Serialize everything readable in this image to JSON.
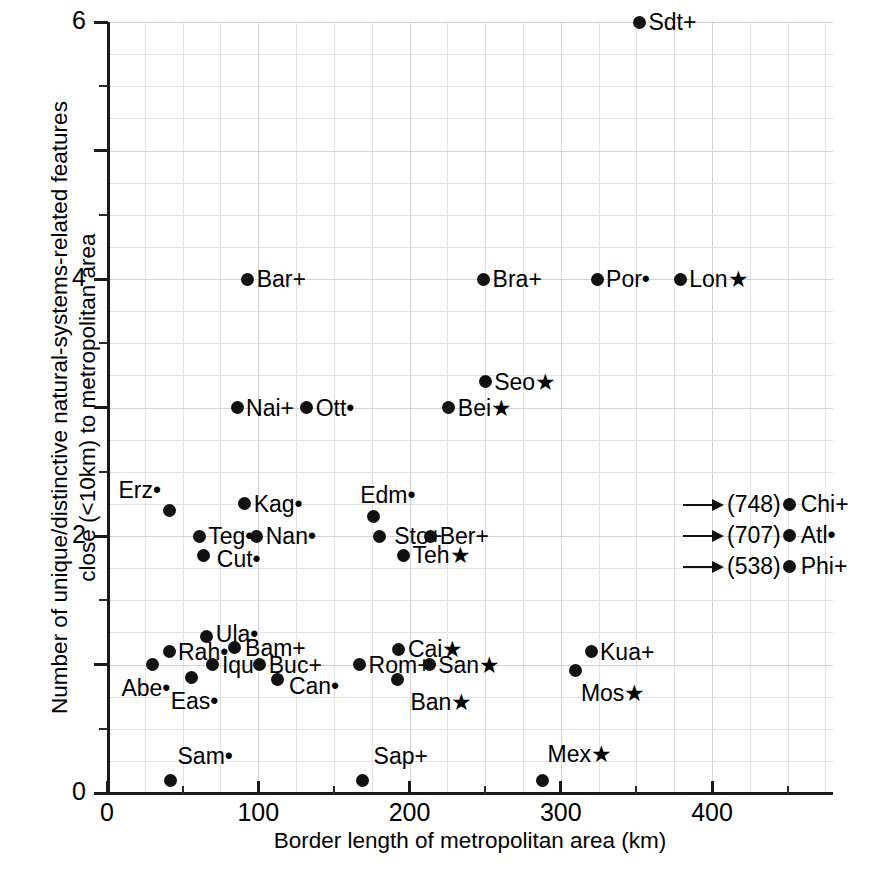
{
  "chart_data": {
    "type": "scatter",
    "title": "",
    "xlabel": "Border length of metropolitan area (km)",
    "ylabel_line1": "Number of unique/distinctive natural-systems-related features",
    "ylabel_line2": "close (<10km) to metropolitan area",
    "xlim": [
      0,
      480
    ],
    "ylim": [
      0,
      6
    ],
    "x_major_ticks": [
      0,
      100,
      200,
      300,
      400
    ],
    "x_major_tick_labels": [
      "0",
      "100",
      "200",
      "300",
      "400"
    ],
    "x_minor_ticks": [
      50,
      150,
      250,
      350,
      450
    ],
    "y_major_ticks": [
      0,
      1,
      2,
      3,
      4,
      5,
      6
    ],
    "y_major_tick_labels": [
      "0",
      "",
      "2",
      "",
      "4",
      "",
      "6"
    ],
    "y_visible_tick_labels": [
      "0",
      "2",
      "4",
      "6"
    ],
    "grid": true,
    "legend_position": "inside-right",
    "marker": "filled-circle",
    "points": [
      {
        "name": "Sdt+",
        "label": "Sdt+",
        "x": 352,
        "y": 6.0,
        "label_side": "right",
        "suffix": "+"
      },
      {
        "name": "Bar+",
        "label": "Bar+",
        "x": 93,
        "y": 4.0,
        "label_side": "right",
        "suffix": "+"
      },
      {
        "name": "Bra+",
        "label": "Bra+",
        "x": 249,
        "y": 4.0,
        "label_side": "right",
        "suffix": "+"
      },
      {
        "name": "Por.",
        "label": "Por•",
        "x": 324,
        "y": 4.0,
        "label_side": "right",
        "suffix": "dot"
      },
      {
        "name": "Lon*",
        "label": "Lon★",
        "x": 379,
        "y": 4.0,
        "label_side": "right",
        "suffix": "star"
      },
      {
        "name": "Seo*",
        "label": "Seo★",
        "x": 250,
        "y": 3.2,
        "label_side": "right",
        "suffix": "star"
      },
      {
        "name": "Nai+",
        "label": "Nai+",
        "x": 86,
        "y": 3.0,
        "label_side": "right",
        "suffix": "+"
      },
      {
        "name": "Ott.",
        "label": "Ott•",
        "x": 132,
        "y": 3.0,
        "label_side": "right",
        "suffix": "dot"
      },
      {
        "name": "Bei*",
        "label": "Bei★",
        "x": 226,
        "y": 3.0,
        "label_side": "right",
        "suffix": "star"
      },
      {
        "name": "Erz.",
        "label": "Erz•",
        "x": 41,
        "y": 2.2,
        "label_side": "right-offset",
        "suffix": "dot"
      },
      {
        "name": "Kag.",
        "label": "Kag•",
        "x": 91,
        "y": 2.25,
        "label_side": "right",
        "suffix": "dot"
      },
      {
        "name": "Teg.",
        "label": "Teg•",
        "x": 61,
        "y": 2.0,
        "label_side": "right",
        "suffix": "dot"
      },
      {
        "name": "Nan.",
        "label": "Nan•",
        "x": 99,
        "y": 2.0,
        "label_side": "right",
        "suffix": "dot"
      },
      {
        "name": "Cut.",
        "label": "Cut•",
        "x": 64,
        "y": 1.85,
        "label_side": "right",
        "suffix": "dot"
      },
      {
        "name": "Edm.",
        "label": "Edm•",
        "x": 176,
        "y": 2.15,
        "label_side": "right",
        "suffix": "dot"
      },
      {
        "name": "Sto+",
        "label": "Sto+",
        "x": 180,
        "y": 2.0,
        "label_side": "right",
        "suffix": "+"
      },
      {
        "name": "Ber+",
        "label": "Ber+",
        "x": 214,
        "y": 2.0,
        "label_side": "right",
        "suffix": "+"
      },
      {
        "name": "Teh*",
        "label": "Teh★",
        "x": 196,
        "y": 1.85,
        "label_side": "right",
        "suffix": "star"
      },
      {
        "name": "Ula.",
        "label": "Ula•",
        "x": 66,
        "y": 1.22,
        "label_side": "right",
        "suffix": "dot"
      },
      {
        "name": "Bam+",
        "label": "Bam+",
        "x": 84,
        "y": 1.13,
        "label_side": "right",
        "suffix": "+"
      },
      {
        "name": "Rah.",
        "label": "Rah•",
        "x": 41,
        "y": 1.1,
        "label_side": "right",
        "suffix": "dot"
      },
      {
        "name": "Abe.",
        "label": "Abe•",
        "x": 30,
        "y": 1.0,
        "label_side": "below-left",
        "suffix": "dot"
      },
      {
        "name": "Iqu.",
        "label": "Iqu•",
        "x": 70,
        "y": 1.0,
        "label_side": "right",
        "suffix": "dot"
      },
      {
        "name": "Buc+",
        "label": "Buc+",
        "x": 101,
        "y": 1.0,
        "label_side": "right",
        "suffix": "+"
      },
      {
        "name": "Rom+",
        "label": "Rom+",
        "x": 167,
        "y": 1.0,
        "label_side": "right",
        "suffix": "+"
      },
      {
        "name": "San*",
        "label": "San★",
        "x": 213,
        "y": 1.0,
        "label_side": "right",
        "suffix": "star"
      },
      {
        "name": "Cai*",
        "label": "Cai★",
        "x": 193,
        "y": 1.12,
        "label_side": "right",
        "suffix": "star"
      },
      {
        "name": "Ban*",
        "label": "Ban★",
        "x": 192,
        "y": 0.88,
        "label_side": "right",
        "suffix": "star"
      },
      {
        "name": "Eas.",
        "label": "Eas•",
        "x": 56,
        "y": 0.9,
        "label_side": "right",
        "suffix": "dot"
      },
      {
        "name": "Can.",
        "label": "Can•",
        "x": 113,
        "y": 0.88,
        "label_side": "right",
        "suffix": "dot"
      },
      {
        "name": "Kua+",
        "label": "Kua+",
        "x": 320,
        "y": 1.1,
        "label_side": "right",
        "suffix": "+"
      },
      {
        "name": "Mos*",
        "label": "Mos★",
        "x": 310,
        "y": 0.95,
        "label_side": "right",
        "suffix": "star"
      },
      {
        "name": "Sam.",
        "label": "Sam•",
        "x": 42,
        "y": 0.1,
        "label_side": "right",
        "suffix": "dot"
      },
      {
        "name": "Sap+",
        "label": "Sap+",
        "x": 169,
        "y": 0.1,
        "label_side": "right",
        "suffix": "+"
      },
      {
        "name": "Mex*",
        "label": "Mex★",
        "x": 288,
        "y": 0.1,
        "label_side": "right",
        "suffix": "star"
      }
    ],
    "offscale_points": [
      {
        "name": "Chi+",
        "value": "(748)",
        "label": "Chi+",
        "x": 748,
        "y": 2.2,
        "suffix": "+"
      },
      {
        "name": "Atl.",
        "value": "(707)",
        "label": "Atl•",
        "x": 707,
        "y": 2.1,
        "suffix": "dot"
      },
      {
        "name": "Phi+",
        "value": "(538)",
        "label": "Phi+",
        "x": 538,
        "y": 2.0,
        "suffix": "+"
      }
    ]
  }
}
